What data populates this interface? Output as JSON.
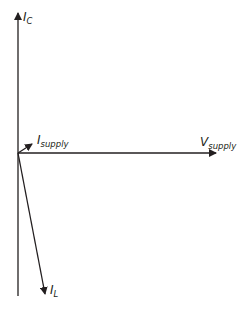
{
  "diagram": {
    "type": "phasor-diagram",
    "line_color": "#231f20",
    "origin": {
      "x": 18,
      "y": 153
    },
    "phasors": [
      {
        "name": "I_C",
        "label_main": "I",
        "label_sub": "C",
        "from": [
          18,
          153
        ],
        "to": [
          18,
          13
        ],
        "label_pos": [
          23,
          12
        ]
      },
      {
        "name": "I_supply",
        "label_main": "I",
        "label_sub": "supply",
        "from": [
          18,
          153
        ],
        "to": [
          32,
          144
        ],
        "label_pos": [
          37,
          134
        ]
      },
      {
        "name": "V_supply",
        "label_main": "V",
        "label_sub": "supply",
        "from": [
          18,
          153
        ],
        "to": [
          216,
          153
        ],
        "label_pos": [
          201,
          137
        ]
      },
      {
        "name": "I_L",
        "label_main": "I",
        "label_sub": "L",
        "from": [
          18,
          153
        ],
        "to": [
          45,
          294
        ],
        "label_pos": [
          50,
          285
        ]
      }
    ],
    "axis_extension": {
      "from": [
        18,
        153
      ],
      "to": [
        18,
        296
      ]
    }
  }
}
